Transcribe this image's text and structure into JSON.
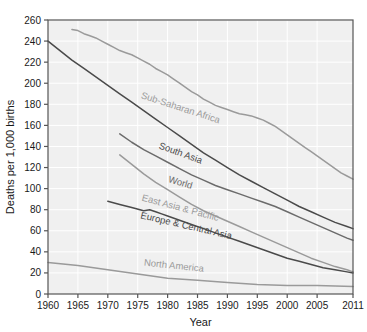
{
  "chart_data": {
    "type": "line",
    "title": "",
    "xlabel": "Year",
    "ylabel": "Deaths per 1,000 births",
    "xlim": [
      1960,
      2011
    ],
    "ylim": [
      0,
      260
    ],
    "xticks": [
      1960,
      1965,
      1970,
      1975,
      1980,
      1985,
      1990,
      1995,
      2000,
      2005,
      2011
    ],
    "yticks": [
      0,
      20,
      40,
      60,
      80,
      100,
      120,
      140,
      160,
      180,
      200,
      220,
      240,
      260
    ],
    "grid": true,
    "legend": "inline-labels",
    "series": [
      {
        "name": "Sub-Saharan Africa",
        "color": "#9a9a9a",
        "label_x": 1982,
        "label_y": 174,
        "label_angle": 18,
        "x": [
          1964,
          1965,
          1966,
          1967,
          1968,
          1969,
          1970,
          1971,
          1972,
          1973,
          1974,
          1975,
          1976,
          1977,
          1978,
          1979,
          1980,
          1981,
          1982,
          1983,
          1984,
          1985,
          1986,
          1987,
          1988,
          1989,
          1990,
          1991,
          1992,
          1993,
          1994,
          1995,
          1996,
          1997,
          1998,
          1999,
          2000,
          2001,
          2002,
          2003,
          2004,
          2005,
          2006,
          2007,
          2008,
          2009,
          2010,
          2011
        ],
        "y": [
          251,
          250,
          247,
          245,
          243,
          240,
          237,
          234,
          231,
          229,
          227,
          224,
          221,
          218,
          214,
          211,
          208,
          204,
          200,
          196,
          192,
          189,
          185,
          182,
          179,
          177,
          175,
          173,
          171,
          170,
          169,
          167,
          165,
          162,
          159,
          155,
          151,
          147,
          143,
          139,
          135,
          131,
          127,
          123,
          119,
          115,
          112,
          109
        ]
      },
      {
        "name": "South Asia",
        "color": "#4a4a4a",
        "label_x": 1982,
        "label_y": 131,
        "label_angle": 20,
        "x": [
          1960,
          1962,
          1964,
          1966,
          1968,
          1970,
          1972,
          1974,
          1976,
          1978,
          1980,
          1982,
          1984,
          1986,
          1988,
          1990,
          1992,
          1994,
          1996,
          1998,
          2000,
          2002,
          2004,
          2006,
          2008,
          2010,
          2011
        ],
        "y": [
          240,
          231,
          222,
          214,
          206,
          198,
          190,
          182,
          174,
          166,
          158,
          150,
          142,
          134,
          127,
          120,
          113,
          107,
          101,
          95,
          89,
          83,
          78,
          73,
          68,
          64,
          62
        ]
      },
      {
        "name": "World",
        "color": "#6b6b6b",
        "label_x": 1982,
        "label_y": 103,
        "label_angle": 16,
        "x": [
          1972,
          1974,
          1976,
          1978,
          1980,
          1982,
          1984,
          1986,
          1988,
          1990,
          1992,
          1994,
          1996,
          1998,
          2000,
          2002,
          2004,
          2006,
          2008,
          2010,
          2011
        ],
        "y": [
          152,
          144,
          137,
          131,
          125,
          119,
          113,
          108,
          103,
          99,
          95,
          91,
          87,
          83,
          78,
          73,
          68,
          63,
          58,
          53,
          51
        ]
      },
      {
        "name": "East Asia & Pacific",
        "color": "#9a9a9a",
        "label_x": 1982,
        "label_y": 79,
        "label_angle": 15,
        "x": [
          1972,
          1974,
          1976,
          1978,
          1980,
          1982,
          1984,
          1986,
          1988,
          1990,
          1992,
          1994,
          1996,
          1998,
          2000,
          2002,
          2004,
          2006,
          2008,
          2010,
          2011
        ],
        "y": [
          132,
          123,
          114,
          106,
          99,
          92,
          85,
          79,
          74,
          69,
          64,
          59,
          54,
          49,
          44,
          39,
          34,
          30,
          26,
          23,
          21
        ]
      },
      {
        "name": "Europe & Central Asia",
        "color": "#4a4a4a",
        "label_x": 1983,
        "label_y": 62,
        "label_angle": 13,
        "x": [
          1970,
          1972,
          1974,
          1976,
          1977,
          1978,
          1979,
          1980,
          1982,
          1984,
          1986,
          1988,
          1990,
          1992,
          1994,
          1996,
          1998,
          2000,
          2002,
          2004,
          2006,
          2008,
          2010,
          2011
        ],
        "y": [
          88,
          85,
          82,
          79,
          80,
          78,
          76,
          74,
          70,
          66,
          62,
          58,
          54,
          50,
          46,
          42,
          38,
          34,
          31,
          28,
          25,
          23,
          21,
          20
        ]
      },
      {
        "name": "North America",
        "color": "#9a9a9a",
        "label_x": 1981,
        "label_y": 24,
        "label_angle": 6,
        "x": [
          1960,
          1965,
          1970,
          1975,
          1980,
          1985,
          1990,
          1995,
          2000,
          2005,
          2011
        ],
        "y": [
          30,
          27,
          23,
          19,
          15,
          13,
          11,
          9,
          8,
          8,
          7
        ]
      }
    ]
  },
  "style": {
    "plot_bg": "#f0f0f0",
    "grid_color": "#ffffff",
    "frame_color": "#555555",
    "text_color": "#1a1a1a"
  }
}
